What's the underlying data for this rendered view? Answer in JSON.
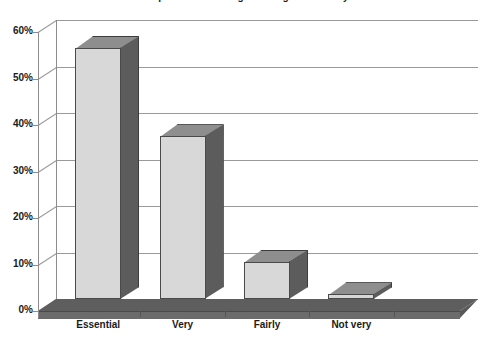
{
  "chart_data": {
    "type": "bar",
    "title": "Importance of being able to go on holiday",
    "categories": [
      "Essential",
      "Very",
      "Fairly",
      "Not very",
      ""
    ],
    "values": [
      54,
      35,
      8,
      1,
      0
    ],
    "value_labels": [
      "54%",
      "35%",
      "8%",
      "1%",
      "0%"
    ],
    "xlabel": "",
    "ylabel": "",
    "ylim": [
      0,
      60
    ],
    "ytick_labels": [
      "0%",
      "10%",
      "20%",
      "30%",
      "40%",
      "50%",
      "60%"
    ],
    "ytick_values": [
      0,
      10,
      20,
      30,
      40,
      50,
      60
    ],
    "grid": true,
    "legend": "none",
    "style": "3d-column",
    "colors": {
      "bar_front": "#d8d8d8",
      "bar_side": "#5c5c5c",
      "bar_top": "#8e8e8e",
      "gridline": "#9a9a9a",
      "floor": "#5e5e5e",
      "text": "#1a1a1a",
      "background": "#ffffff"
    }
  },
  "axes": {
    "y_ticks": [
      {
        "label": "60%",
        "value": 60
      },
      {
        "label": "50%",
        "value": 50
      },
      {
        "label": "40%",
        "value": 40
      },
      {
        "label": "30%",
        "value": 30
      },
      {
        "label": "20%",
        "value": 20
      },
      {
        "label": "10%",
        "value": 10
      },
      {
        "label": "0%",
        "value": 0
      }
    ],
    "x_ticks": [
      {
        "label": "Essential"
      },
      {
        "label": "Very"
      },
      {
        "label": "Fairly"
      },
      {
        "label": "Not very"
      },
      {
        "label": ""
      }
    ]
  }
}
